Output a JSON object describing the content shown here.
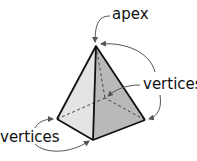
{
  "diagram": {
    "labels": {
      "apex": "apex",
      "vertices_right": "vertices",
      "vertices_left": "vertices"
    },
    "colors": {
      "left_face": "#e4e4e4",
      "right_face": "#b9b9b9",
      "edge": "#111111",
      "hidden_edge": "#444444",
      "arrow": "#555555"
    }
  }
}
